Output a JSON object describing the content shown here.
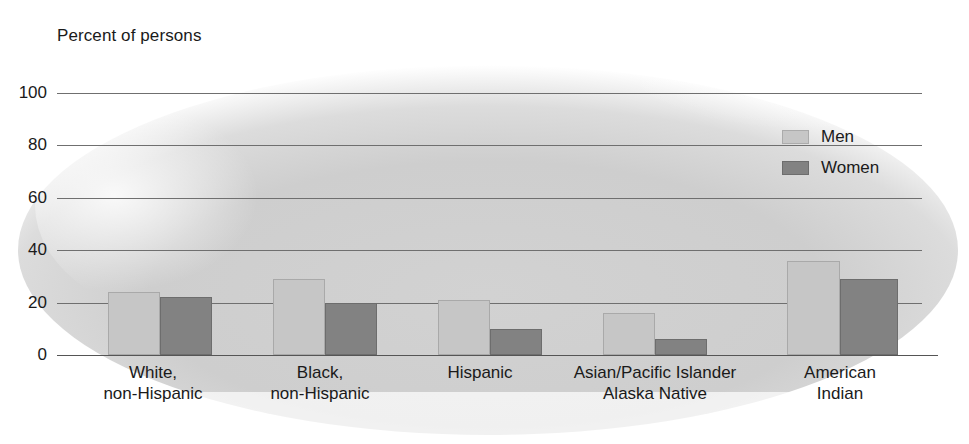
{
  "chart_data": {
    "type": "bar",
    "title": "",
    "ylabel": "Percent of persons",
    "xlabel": "",
    "ylim": [
      0,
      100
    ],
    "yticks": [
      0,
      20,
      40,
      60,
      80,
      100
    ],
    "ytick_labels": [
      "0",
      "20",
      "40",
      "60",
      "80",
      "100"
    ],
    "grid": true,
    "legend_position": "upper right",
    "categories": [
      "White,\nnon-Hispanic",
      "Black,\nnon-Hispanic",
      "Hispanic",
      "Asian/Pacific Islander\nAlaska Native",
      "American\nIndian"
    ],
    "category_lines": [
      [
        "White,",
        "non-Hispanic"
      ],
      [
        "Black,",
        "non-Hispanic"
      ],
      [
        "Hispanic",
        ""
      ],
      [
        "Asian/Pacific Islander",
        "Alaska Native"
      ],
      [
        "American",
        "Indian"
      ]
    ],
    "series": [
      {
        "name": "Men",
        "color": "#c6c6c6",
        "values": [
          24,
          29,
          21,
          16,
          36
        ]
      },
      {
        "name": "Women",
        "color": "#828282",
        "values": [
          22,
          20,
          10,
          6,
          29
        ]
      }
    ]
  },
  "legend": {
    "items": [
      {
        "label": "Men"
      },
      {
        "label": "Women"
      }
    ]
  },
  "colors": {
    "men": "#c6c6c6",
    "women": "#828282",
    "gridline": "#6f6f6f",
    "text": "#1a1a1a",
    "background": "#ffffff"
  }
}
